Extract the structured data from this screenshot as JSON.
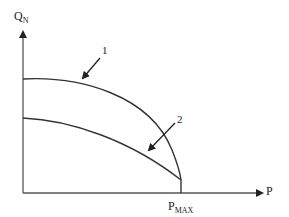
{
  "diagram": {
    "type": "qualitative curve diagram",
    "y_axis": {
      "label": "Q",
      "label_subscript": "N"
    },
    "x_axis": {
      "label": "P"
    },
    "x_marker": {
      "label": "P",
      "label_subscript": "MAX"
    },
    "curves": [
      {
        "id": "1",
        "label": "1",
        "description": "upper curve from Q-axis to P_MAX"
      },
      {
        "id": "2",
        "label": "2",
        "description": "lower curve from Q-axis to P_MAX"
      }
    ],
    "colors": {
      "line": "#333333",
      "background": "#ffffff"
    }
  }
}
